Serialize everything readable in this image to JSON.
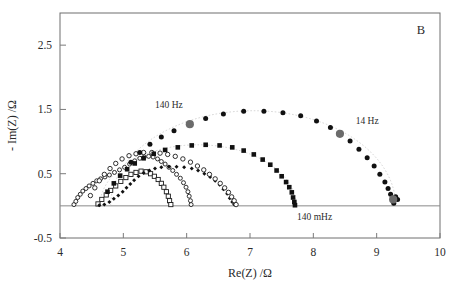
{
  "figure": {
    "panel_label": "B",
    "background": "#ffffff"
  },
  "chart_data": {
    "type": "scatter",
    "title": "",
    "subtitle": "",
    "xlabel": "Re(Z) /Ω",
    "ylabel": "- Im(Z) /Ω",
    "xlim": [
      4,
      10
    ],
    "ylim": [
      -0.5,
      3.0
    ],
    "xticks": [
      4,
      5,
      6,
      7,
      8,
      9,
      10
    ],
    "xtick_labels": [
      "4",
      "5",
      "6",
      "7",
      "8",
      "9",
      "10"
    ],
    "yticks": [
      -0.5,
      0.5,
      1.5,
      2.5
    ],
    "ytick_labels": [
      "-0.5",
      "0.5",
      "1.5",
      "2.5"
    ],
    "grid": false,
    "legend": "none",
    "annotations": [
      {
        "text": "140 Hz",
        "x": 5.72,
        "y": 1.52,
        "marker_x": 6.05,
        "marker_y": 1.27,
        "marker_color": "#6b6b6b"
      },
      {
        "text": "14 Hz",
        "x": 8.85,
        "y": 1.27,
        "marker_x": 8.42,
        "marker_y": 1.12,
        "marker_color": "#6b6b6b"
      },
      {
        "text": "140 mHz",
        "x": 8.02,
        "y": -0.22,
        "marker_x": 9.26,
        "marker_y": 0.1,
        "marker_color": "#6b6b6b"
      }
    ],
    "marker_colors": {
      "filled": "#111111",
      "open_fill": "#ffffff",
      "open_stroke": "#1a1a1a",
      "highlight": "#6b6b6b",
      "guide": "#b9b9b9"
    },
    "series": [
      {
        "name": "arc-1-open-circle-small",
        "marker": "open-circle",
        "size": 4.0,
        "points": [
          [
            4.22,
            0.02
          ],
          [
            4.25,
            0.07
          ],
          [
            4.28,
            0.13
          ],
          [
            4.32,
            0.18
          ],
          [
            4.36,
            0.23
          ],
          [
            4.41,
            0.27
          ],
          [
            4.46,
            0.31
          ],
          [
            4.52,
            0.35
          ],
          [
            4.58,
            0.39
          ],
          [
            4.64,
            0.42
          ],
          [
            4.71,
            0.45
          ],
          [
            4.78,
            0.48
          ],
          [
            4.86,
            0.52
          ],
          [
            4.94,
            0.56
          ],
          [
            5.02,
            0.6
          ],
          [
            5.1,
            0.65
          ],
          [
            5.18,
            0.7
          ],
          [
            5.26,
            0.74
          ],
          [
            5.33,
            0.76
          ],
          [
            5.4,
            0.77
          ],
          [
            5.47,
            0.76
          ],
          [
            5.54,
            0.73
          ],
          [
            5.6,
            0.69
          ],
          [
            5.66,
            0.65
          ],
          [
            5.72,
            0.6
          ],
          [
            5.78,
            0.55
          ],
          [
            5.84,
            0.49
          ],
          [
            5.9,
            0.43
          ],
          [
            5.95,
            0.36
          ],
          [
            5.99,
            0.29
          ],
          [
            6.02,
            0.22
          ],
          [
            6.04,
            0.15
          ],
          [
            6.06,
            0.08
          ],
          [
            6.07,
            0.02
          ]
        ]
      },
      {
        "name": "arc-2-open-square",
        "marker": "open-square",
        "size": 4.2,
        "points": [
          [
            4.6,
            0.03
          ],
          [
            4.66,
            0.1
          ],
          [
            4.73,
            0.17
          ],
          [
            4.8,
            0.24
          ],
          [
            4.88,
            0.31
          ],
          [
            4.96,
            0.38
          ],
          [
            5.04,
            0.44
          ],
          [
            5.12,
            0.49
          ],
          [
            5.2,
            0.52
          ],
          [
            5.28,
            0.54
          ],
          [
            5.36,
            0.53
          ],
          [
            5.43,
            0.5
          ],
          [
            5.49,
            0.46
          ],
          [
            5.55,
            0.41
          ],
          [
            5.6,
            0.35
          ],
          [
            5.64,
            0.29
          ],
          [
            5.68,
            0.22
          ],
          [
            5.71,
            0.15
          ],
          [
            5.73,
            0.08
          ],
          [
            5.75,
            0.02
          ]
        ]
      },
      {
        "name": "arc-3-filled-diamond",
        "marker": "filled-diamond",
        "size": 4.0,
        "points": [
          [
            4.62,
            0.01
          ],
          [
            4.7,
            0.02
          ],
          [
            4.78,
            0.06
          ],
          [
            4.85,
            0.11
          ],
          [
            4.92,
            0.16
          ],
          [
            4.99,
            0.22
          ],
          [
            5.05,
            0.28
          ],
          [
            5.11,
            0.34
          ],
          [
            5.17,
            0.4
          ],
          [
            5.24,
            0.46
          ],
          [
            5.32,
            0.51
          ],
          [
            5.41,
            0.55
          ],
          [
            5.5,
            0.58
          ],
          [
            5.6,
            0.6
          ],
          [
            5.72,
            0.61
          ],
          [
            5.84,
            0.61
          ],
          [
            5.96,
            0.6
          ],
          [
            6.08,
            0.58
          ],
          [
            6.18,
            0.55
          ],
          [
            6.28,
            0.5
          ],
          [
            6.37,
            0.45
          ],
          [
            6.45,
            0.39
          ],
          [
            6.52,
            0.33
          ],
          [
            6.58,
            0.26
          ],
          [
            6.64,
            0.19
          ],
          [
            6.68,
            0.12
          ],
          [
            6.72,
            0.06
          ],
          [
            6.75,
            0.02
          ]
        ]
      },
      {
        "name": "arc-4-open-circle-mid",
        "marker": "open-circle",
        "size": 4.4,
        "points": [
          [
            4.48,
            0.16
          ],
          [
            4.55,
            0.28
          ],
          [
            4.62,
            0.39
          ],
          [
            4.7,
            0.49
          ],
          [
            4.79,
            0.58
          ],
          [
            4.88,
            0.66
          ],
          [
            4.98,
            0.73
          ],
          [
            5.09,
            0.78
          ],
          [
            5.2,
            0.81
          ],
          [
            5.32,
            0.83
          ],
          [
            5.45,
            0.83
          ],
          [
            5.58,
            0.82
          ],
          [
            5.7,
            0.8
          ],
          [
            5.82,
            0.77
          ],
          [
            5.94,
            0.73
          ],
          [
            6.06,
            0.68
          ],
          [
            6.17,
            0.62
          ],
          [
            6.27,
            0.56
          ],
          [
            6.36,
            0.49
          ],
          [
            6.45,
            0.42
          ],
          [
            6.53,
            0.35
          ],
          [
            6.6,
            0.28
          ],
          [
            6.66,
            0.21
          ],
          [
            6.71,
            0.14
          ],
          [
            6.75,
            0.08
          ],
          [
            6.78,
            0.02
          ]
        ]
      },
      {
        "name": "arc-5-filled-square",
        "marker": "filled-square",
        "size": 4.6,
        "points": [
          [
            4.75,
            0.22
          ],
          [
            4.85,
            0.35
          ],
          [
            4.95,
            0.47
          ],
          [
            5.06,
            0.57
          ],
          [
            5.18,
            0.66
          ],
          [
            5.32,
            0.74
          ],
          [
            5.48,
            0.81
          ],
          [
            5.66,
            0.87
          ],
          [
            5.86,
            0.91
          ],
          [
            6.08,
            0.94
          ],
          [
            6.3,
            0.95
          ],
          [
            6.52,
            0.94
          ],
          [
            6.72,
            0.91
          ],
          [
            6.9,
            0.86
          ],
          [
            7.06,
            0.8
          ],
          [
            7.2,
            0.72
          ],
          [
            7.32,
            0.64
          ],
          [
            7.42,
            0.55
          ],
          [
            7.5,
            0.46
          ],
          [
            7.57,
            0.37
          ],
          [
            7.62,
            0.29
          ],
          [
            7.66,
            0.21
          ],
          [
            7.68,
            0.13
          ],
          [
            7.7,
            0.06
          ],
          [
            7.71,
            0.01
          ]
        ]
      },
      {
        "name": "arc-6-filled-circle-large",
        "marker": "filled-circle",
        "size": 5.0,
        "points": [
          [
            5.12,
            0.68
          ],
          [
            5.26,
            0.83
          ],
          [
            5.42,
            0.96
          ],
          [
            5.6,
            1.07
          ],
          [
            5.8,
            1.17
          ],
          [
            6.05,
            1.27
          ],
          [
            6.3,
            1.36
          ],
          [
            6.58,
            1.43
          ],
          [
            6.9,
            1.47
          ],
          [
            7.22,
            1.47
          ],
          [
            7.52,
            1.45
          ],
          [
            7.8,
            1.4
          ],
          [
            8.05,
            1.32
          ],
          [
            8.27,
            1.22
          ],
          [
            8.42,
            1.12
          ],
          [
            8.58,
            1.01
          ],
          [
            8.72,
            0.88
          ],
          [
            8.85,
            0.75
          ],
          [
            8.96,
            0.62
          ],
          [
            9.05,
            0.49
          ],
          [
            9.13,
            0.37
          ],
          [
            9.18,
            0.27
          ],
          [
            9.22,
            0.18
          ],
          [
            9.26,
            0.1
          ],
          [
            9.3,
            0.14
          ],
          [
            9.33,
            0.1
          ],
          [
            9.27,
            0.04
          ]
        ]
      }
    ],
    "guide_arcs": [
      {
        "name": "guide-large",
        "cx": 7.05,
        "cy": 0.0,
        "rx": 2.25,
        "ry": 1.48
      },
      {
        "name": "guide-mid",
        "cx": 6.18,
        "cy": 0.0,
        "rx": 1.55,
        "ry": 0.95
      }
    ]
  }
}
